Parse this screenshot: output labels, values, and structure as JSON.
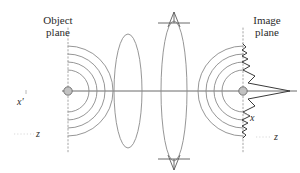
{
  "figure": {
    "width": 300,
    "height": 173,
    "background_color": "#ffffff",
    "stroke_color": "#4a4a4a",
    "dotted_color": "#9a9a9a",
    "point_fill": "#b8b8b8",
    "text_color": "#2b2b2b"
  },
  "labels": {
    "object_plane": "Object\nplane",
    "object_plane_line1": "Object",
    "object_plane_line2": "plane",
    "image_plane_line1": "Image",
    "image_plane_line2": "plane",
    "axis_x_prime": "x′",
    "axis_z_left": "z",
    "axis_x_right": "x",
    "axis_z_right": "z"
  },
  "elements": {
    "object_plane_line": "vertical-dotted-line",
    "image_plane_line": "vertical-dotted-line",
    "object_point": "source-point-marker",
    "image_point": "image-point-marker",
    "optical_axis": "horizontal-axis-line",
    "diverging_wavefronts": "concentric-arcs-left",
    "converging_wavefronts": "concentric-arcs-right",
    "lens_one": "thin-lens-ellipse",
    "lens_two": "aperture-lens-ellipse",
    "aperture_arrow_top": "up-arrow-marker",
    "aperture_arrow_bottom": "down-arrow-marker",
    "point_spread_function": "sinc-profile-curve"
  },
  "geometry": {
    "object_plane_x": 68,
    "image_plane_x": 243,
    "optical_axis_y": 91,
    "lens_one_center_x": 128,
    "lens_two_center_x": 174,
    "object_point_xy": [
      68,
      91
    ],
    "image_point_xy": [
      243,
      91
    ],
    "diverging_arc_radii": [
      14,
      22,
      30,
      38
    ],
    "converging_arc_radii": [
      14,
      22,
      30,
      38
    ]
  }
}
